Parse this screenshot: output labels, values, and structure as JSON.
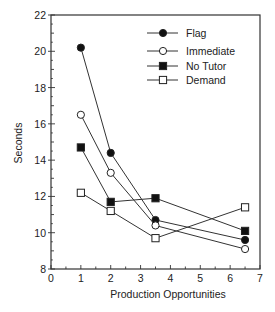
{
  "chart_data": {
    "type": "line",
    "title": "",
    "xlabel": "Production Opportunities",
    "ylabel": "Seconds",
    "xlim": [
      0,
      7
    ],
    "ylim": [
      8,
      22
    ],
    "x_ticks": [
      0,
      1,
      2,
      3,
      4,
      5,
      6,
      7
    ],
    "y_ticks": [
      8,
      10,
      12,
      14,
      16,
      18,
      20,
      22
    ],
    "grid": false,
    "legend_position": "upper right (inside)",
    "x": [
      1,
      2,
      3.5,
      6.5
    ],
    "series": [
      {
        "name": "Flag",
        "marker": "filled-circle",
        "values": [
          20.2,
          14.4,
          10.7,
          9.6
        ]
      },
      {
        "name": "Immediate",
        "marker": "open-circle",
        "values": [
          16.5,
          13.3,
          10.4,
          9.1
        ]
      },
      {
        "name": "No Tutor",
        "marker": "filled-square",
        "values": [
          14.7,
          11.7,
          11.9,
          10.1
        ]
      },
      {
        "name": "Demand",
        "marker": "open-square",
        "values": [
          12.2,
          11.2,
          9.7,
          11.4
        ]
      }
    ]
  },
  "colors": {
    "line": "#333333",
    "marker_fill": "#111111",
    "background": "#ffffff"
  }
}
